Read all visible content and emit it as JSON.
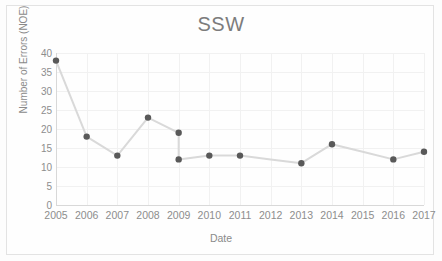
{
  "figure": {
    "title": "SSW",
    "xlabel": "Date",
    "ylabel": "Number of Errors (NOE)",
    "line_color": "#d9d9d9",
    "marker_color": "#595959",
    "grid_color": "#f1f1f1",
    "text_color": "#8d8d8d"
  },
  "chart_data": {
    "type": "line",
    "title": "SSW",
    "xlabel": "Date",
    "ylabel": "Number of Errors (NOE)",
    "xlim": [
      2005,
      2017
    ],
    "ylim": [
      0,
      40
    ],
    "ytick_step": 5,
    "grid": true,
    "legend": "none",
    "markers": true,
    "xtick_labels": [
      "2005",
      "2006",
      "2007",
      "2008",
      "2009",
      "2010",
      "2011",
      "2012",
      "2013",
      "2014",
      "2015",
      "2016",
      "2017"
    ],
    "ytick_labels": [
      "40",
      "35",
      "30",
      "25",
      "20",
      "15",
      "10",
      "5",
      "0"
    ],
    "x": [
      2005,
      2006,
      2007,
      2008,
      2009,
      2009,
      2010,
      2011,
      2012,
      2013,
      2014,
      2015,
      2016,
      2017
    ],
    "values": [
      38,
      18,
      13,
      23,
      19,
      12,
      13,
      13,
      12,
      11,
      16,
      14,
      12,
      14
    ],
    "points": [
      {
        "x": 2005,
        "y": 38,
        "marker": true
      },
      {
        "x": 2006,
        "y": 18,
        "marker": true
      },
      {
        "x": 2007,
        "y": 13,
        "marker": true
      },
      {
        "x": 2008,
        "y": 23,
        "marker": true
      },
      {
        "x": 2009,
        "y": 19,
        "marker": true
      },
      {
        "x": 2009,
        "y": 12,
        "marker": true
      },
      {
        "x": 2010,
        "y": 13,
        "marker": true
      },
      {
        "x": 2011,
        "y": 13,
        "marker": true
      },
      {
        "x": 2012,
        "y": 12,
        "marker": false
      },
      {
        "x": 2013,
        "y": 11,
        "marker": true
      },
      {
        "x": 2014,
        "y": 16,
        "marker": true
      },
      {
        "x": 2015,
        "y": 14,
        "marker": false
      },
      {
        "x": 2016,
        "y": 12,
        "marker": true
      },
      {
        "x": 2017,
        "y": 14,
        "marker": true
      }
    ]
  }
}
